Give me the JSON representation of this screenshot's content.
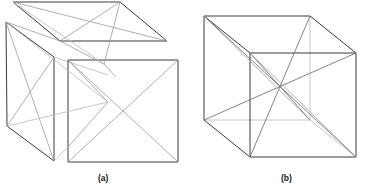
{
  "figure": {
    "kind": "line-diagram",
    "background_color": "#ffffff",
    "stroke_colors": {
      "dark": "#3a3a3a",
      "mid": "#6e6e6e",
      "light": "#9a9a9a",
      "faint": "#b8b8b8"
    },
    "panels": [
      {
        "id": "a",
        "caption": "(a)",
        "description": "exploded cube showing top face, left face and front face separated with face diagonals"
      },
      {
        "id": "b",
        "caption": "(b)",
        "description": "assembled cube drawn in oblique projection with body diagonals meeting at the center"
      }
    ],
    "captions": {
      "a": "(a)",
      "b": "(b)"
    }
  }
}
